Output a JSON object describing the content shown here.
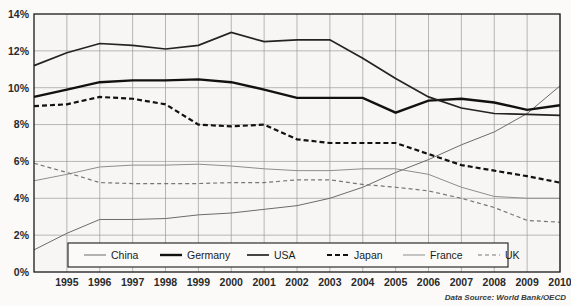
{
  "caption": "Data Source: World Bank/OECD",
  "legend": {
    "entries": [
      {
        "label": "China",
        "style": "thin-solid",
        "color": "#6b6b6b",
        "width": 1.0,
        "dash": "none"
      },
      {
        "label": "Germany",
        "style": "thick-solid",
        "color": "#111111",
        "width": 2.4,
        "dash": "none"
      },
      {
        "label": "USA",
        "style": "medium-solid",
        "color": "#232323",
        "width": 1.7,
        "dash": "none"
      },
      {
        "label": "Japan",
        "style": "thick-dashed",
        "color": "#111111",
        "width": 2.2,
        "dash": "5,3"
      },
      {
        "label": "France",
        "style": "thin-light",
        "color": "#8d8d8d",
        "width": 1.0,
        "dash": "none"
      },
      {
        "label": "UK",
        "style": "thin-dashed",
        "color": "#777777",
        "width": 1.2,
        "dash": "4,3"
      }
    ]
  },
  "chart_data": {
    "type": "line",
    "title": "",
    "xlabel": "",
    "ylabel": "",
    "grid": true,
    "legend_position": "bottom-inside",
    "x": [
      1994,
      1995,
      1996,
      1997,
      1998,
      1999,
      2000,
      2001,
      2002,
      2003,
      2004,
      2005,
      2006,
      2007,
      2008,
      2009,
      2010
    ],
    "xtick_labels": [
      "1995",
      "1996",
      "1997",
      "1998",
      "1999",
      "2000",
      "2001",
      "2002",
      "2003",
      "2004",
      "2005",
      "2006",
      "2007",
      "2008",
      "2009",
      "2010"
    ],
    "xtick_values": [
      1995,
      1996,
      1997,
      1998,
      1999,
      2000,
      2001,
      2002,
      2003,
      2004,
      2005,
      2006,
      2007,
      2008,
      2009,
      2010
    ],
    "xlim": [
      1994,
      2010
    ],
    "ylim": [
      0,
      14
    ],
    "ytick_labels": [
      "0%",
      "2%",
      "4%",
      "6%",
      "8%",
      "10%",
      "12%",
      "14%"
    ],
    "ytick_values": [
      0,
      2,
      4,
      6,
      8,
      10,
      12,
      14
    ],
    "series": [
      {
        "name": "China",
        "color": "#6b6b6b",
        "width": 1.0,
        "dash": "none",
        "values": [
          1.2,
          2.1,
          2.85,
          2.85,
          2.9,
          3.1,
          3.2,
          3.4,
          3.6,
          4.0,
          4.6,
          5.4,
          6.1,
          6.9,
          7.6,
          8.6,
          10.1
        ]
      },
      {
        "name": "Germany",
        "color": "#111111",
        "width": 2.4,
        "dash": "none",
        "values": [
          9.5,
          9.9,
          10.3,
          10.4,
          10.4,
          10.45,
          10.3,
          9.9,
          9.45,
          9.45,
          9.45,
          8.65,
          9.3,
          9.4,
          9.2,
          8.8,
          9.05
        ]
      },
      {
        "name": "USA",
        "color": "#232323",
        "width": 1.7,
        "dash": "none",
        "values": [
          11.2,
          11.9,
          12.4,
          12.3,
          12.1,
          12.3,
          13.0,
          12.5,
          12.6,
          12.6,
          11.6,
          10.5,
          9.5,
          8.9,
          8.6,
          8.55,
          8.5
        ]
      },
      {
        "name": "Japan",
        "color": "#111111",
        "width": 2.2,
        "dash": "5,3",
        "values": [
          9.0,
          9.1,
          9.5,
          9.4,
          9.1,
          8.0,
          7.9,
          8.0,
          7.2,
          7.0,
          7.0,
          7.0,
          6.4,
          5.8,
          5.5,
          5.2,
          4.85
        ]
      },
      {
        "name": "France",
        "color": "#8d8d8d",
        "width": 1.0,
        "dash": "none",
        "values": [
          4.95,
          5.3,
          5.7,
          5.8,
          5.8,
          5.85,
          5.75,
          5.6,
          5.5,
          5.5,
          5.6,
          5.6,
          5.3,
          4.6,
          4.1,
          4.0,
          4.0
        ]
      },
      {
        "name": "UK",
        "color": "#777777",
        "width": 1.2,
        "dash": "4,3",
        "values": [
          5.9,
          5.4,
          4.85,
          4.8,
          4.8,
          4.8,
          4.85,
          4.85,
          5.0,
          5.0,
          4.75,
          4.6,
          4.4,
          4.0,
          3.5,
          2.8,
          2.7
        ]
      }
    ]
  }
}
